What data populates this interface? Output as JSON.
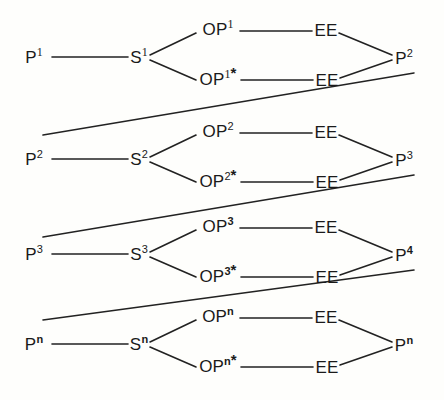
{
  "diagram": {
    "background_color": "#fefefc",
    "stroke_color": "#222222",
    "text_color": "#1a1a1a",
    "rows": [
      {
        "index": 1,
        "left_node": "P",
        "left_sup": "1",
        "mid_node": "S",
        "mid_sup": "1",
        "upper_node": "OP",
        "upper_sup": "1",
        "upper_star": "",
        "upper_right_node": "EE",
        "lower_node": "OP",
        "lower_sup": "1",
        "lower_star": "*",
        "lower_right_node": "EE",
        "right_node": "P",
        "right_sup": "2",
        "has_outgoing_connector": true
      },
      {
        "index": 2,
        "left_node": "P",
        "left_sup": "2",
        "mid_node": "S",
        "mid_sup": "2",
        "upper_node": "OP",
        "upper_sup": "2",
        "upper_star": "",
        "upper_right_node": "EE",
        "lower_node": "OP",
        "lower_sup": "2",
        "lower_star": "*",
        "lower_right_node": "EE",
        "right_node": "P",
        "right_sup": "3",
        "has_outgoing_connector": true
      },
      {
        "index": 3,
        "left_node": "P",
        "left_sup": "3",
        "mid_node": "S",
        "mid_sup": "3",
        "upper_node": "OP",
        "upper_sup": "3",
        "upper_star": "",
        "upper_right_node": "EE",
        "lower_node": "OP",
        "lower_sup": "3",
        "lower_star": "*",
        "lower_right_node": "EE",
        "right_node": "P",
        "right_sup": "4",
        "has_outgoing_connector": true
      },
      {
        "index": 4,
        "left_node": "P",
        "left_sup": "n",
        "mid_node": "S",
        "mid_sup": "n",
        "upper_node": "OP",
        "upper_sup": "n",
        "upper_star": "",
        "upper_right_node": "EE",
        "lower_node": "OP",
        "lower_sup": "n",
        "lower_star": "*",
        "lower_right_node": "EE",
        "right_node": "P",
        "right_sup": "n",
        "has_outgoing_connector": false
      }
    ]
  }
}
